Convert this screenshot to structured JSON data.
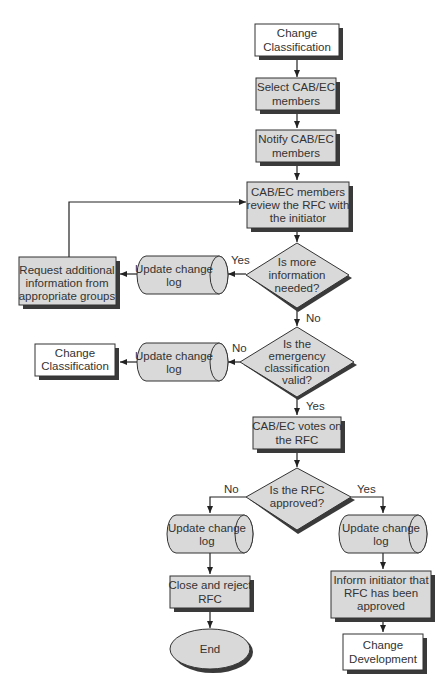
{
  "diagram": {
    "type": "flowchart",
    "nodes": {
      "start": {
        "shape": "process",
        "fill": "white",
        "lines": [
          "Change",
          "Classification"
        ]
      },
      "select_members": {
        "shape": "process",
        "fill": "gray",
        "lines": [
          "Select CAB/EC",
          "members"
        ]
      },
      "notify_members": {
        "shape": "process",
        "fill": "gray",
        "lines": [
          "Notify CAB/EC",
          "members"
        ]
      },
      "review_rfc": {
        "shape": "process",
        "fill": "gray",
        "lines": [
          "CAB/EC members",
          "review the RFC with",
          "the initiator"
        ]
      },
      "more_info_decision": {
        "shape": "decision",
        "lines": [
          "Is more",
          "information",
          "needed?"
        ]
      },
      "update_log_1": {
        "shape": "storage",
        "lines": [
          "Update change",
          "log"
        ]
      },
      "request_info": {
        "shape": "process",
        "fill": "gray",
        "lines": [
          "Request additional",
          "information from",
          "appropriate groups"
        ]
      },
      "emergency_decision": {
        "shape": "decision",
        "lines": [
          "Is the",
          "emergency",
          "classification",
          "valid?"
        ]
      },
      "update_log_2": {
        "shape": "storage",
        "lines": [
          "Update change",
          "log"
        ]
      },
      "change_classification_2": {
        "shape": "process",
        "fill": "white",
        "lines": [
          "Change",
          "Classification"
        ]
      },
      "votes": {
        "shape": "process",
        "fill": "gray",
        "lines": [
          "CAB/EC votes on",
          "the RFC"
        ]
      },
      "approved_decision": {
        "shape": "decision",
        "lines": [
          "Is the RFC",
          "approved?"
        ]
      },
      "update_log_no": {
        "shape": "storage",
        "lines": [
          "Update change",
          "log"
        ]
      },
      "close_reject": {
        "shape": "process",
        "fill": "gray",
        "lines": [
          "Close and reject",
          "RFC"
        ]
      },
      "end": {
        "shape": "terminator",
        "lines": [
          "End"
        ]
      },
      "update_log_yes": {
        "shape": "storage",
        "lines": [
          "Update change",
          "log"
        ]
      },
      "inform_initiator": {
        "shape": "process",
        "fill": "gray",
        "lines": [
          "Inform initiator that",
          "RFC has been",
          "approved"
        ]
      },
      "change_development": {
        "shape": "process",
        "fill": "white",
        "lines": [
          "Change",
          "Development"
        ]
      }
    },
    "edge_labels": {
      "more_info_yes": "Yes",
      "more_info_no": "No",
      "emergency_no": "No",
      "emergency_yes": "Yes",
      "approved_no": "No",
      "approved_yes": "Yes"
    },
    "edges": [
      {
        "from": "start",
        "to": "select_members"
      },
      {
        "from": "select_members",
        "to": "notify_members"
      },
      {
        "from": "notify_members",
        "to": "review_rfc"
      },
      {
        "from": "review_rfc",
        "to": "more_info_decision"
      },
      {
        "from": "more_info_decision",
        "to": "update_log_1",
        "label": "Yes"
      },
      {
        "from": "update_log_1",
        "to": "request_info"
      },
      {
        "from": "request_info",
        "to": "review_rfc"
      },
      {
        "from": "more_info_decision",
        "to": "emergency_decision",
        "label": "No"
      },
      {
        "from": "emergency_decision",
        "to": "update_log_2",
        "label": "No"
      },
      {
        "from": "update_log_2",
        "to": "change_classification_2"
      },
      {
        "from": "emergency_decision",
        "to": "votes",
        "label": "Yes"
      },
      {
        "from": "votes",
        "to": "approved_decision"
      },
      {
        "from": "approved_decision",
        "to": "update_log_no",
        "label": "No"
      },
      {
        "from": "update_log_no",
        "to": "close_reject"
      },
      {
        "from": "close_reject",
        "to": "end"
      },
      {
        "from": "approved_decision",
        "to": "update_log_yes",
        "label": "Yes"
      },
      {
        "from": "update_log_yes",
        "to": "inform_initiator"
      },
      {
        "from": "inform_initiator",
        "to": "change_development"
      }
    ],
    "colors": {
      "gray_fill": "#d9d9d9",
      "white_fill": "#ffffff",
      "stroke": "#333333",
      "shadow": "#3a3a3a"
    }
  }
}
